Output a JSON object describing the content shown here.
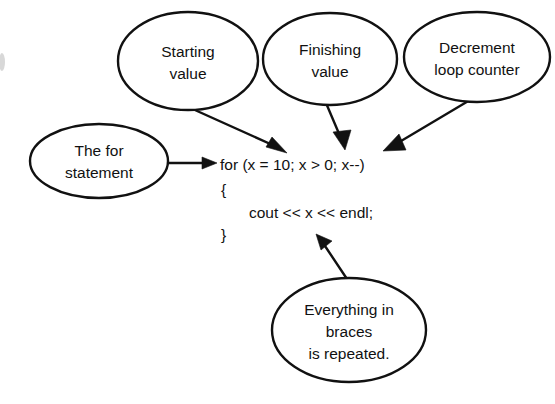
{
  "diagram": {
    "background_color": "#ffffff",
    "stroke_color": "#111111",
    "callouts": [
      {
        "id": "starting-value",
        "lines": [
          "Starting",
          "value"
        ],
        "line1": "Starting",
        "line2": "value",
        "cx": 188,
        "cy": 61,
        "rx": 70,
        "ry": 49
      },
      {
        "id": "finishing-value",
        "lines": [
          "Finishing",
          "value"
        ],
        "line1": "Finishing",
        "line2": "value",
        "cx": 330,
        "cy": 59,
        "rx": 67,
        "ry": 46
      },
      {
        "id": "decrement-loop-counter",
        "lines": [
          "Decrement",
          "loop counter"
        ],
        "line1": "Decrement",
        "line2": "loop counter",
        "cx": 477,
        "cy": 57,
        "rx": 73,
        "ry": 45
      },
      {
        "id": "the-for-statement",
        "lines": [
          "The for",
          "statement"
        ],
        "line1": "The for",
        "line2": "statement",
        "cx": 99,
        "cy": 161,
        "rx": 69,
        "ry": 37
      },
      {
        "id": "everything-in-braces",
        "lines": [
          "Everything in",
          "braces",
          "is repeated."
        ],
        "line1": "Everything in",
        "line2": "braces",
        "line3": "is repeated.",
        "cx": 349,
        "cy": 330,
        "rx": 77,
        "ry": 52
      }
    ],
    "code": {
      "line1": "for (x = 10; x > 0; x--)",
      "line2": "{",
      "line3": "cout << x << endl;",
      "line4": "}"
    },
    "arrows": [
      {
        "id": "arrow-starting-value-to-code",
        "from": "starting-value",
        "to": "code-line1"
      },
      {
        "id": "arrow-finishing-value-to-code",
        "from": "finishing-value",
        "to": "code-line1"
      },
      {
        "id": "arrow-decrement-to-code",
        "from": "decrement-loop-counter",
        "to": "code-line1"
      },
      {
        "id": "arrow-for-statement-to-code",
        "from": "the-for-statement",
        "to": "code-line1"
      },
      {
        "id": "arrow-braces-to-code",
        "from": "everything-in-braces",
        "to": "code-line4"
      }
    ]
  }
}
